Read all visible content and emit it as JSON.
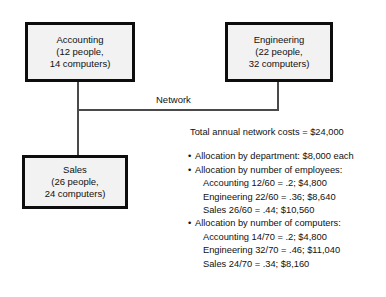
{
  "diagram": {
    "network_label": "Network",
    "nodes": [
      {
        "id": "accounting",
        "name": "Accounting",
        "people": "(12 people,",
        "computers": "14 computers)"
      },
      {
        "id": "engineering",
        "name": "Engineering",
        "people": "(22 people,",
        "computers": "32 computers)"
      },
      {
        "id": "sales",
        "name": "Sales",
        "people": "(26 people,",
        "computers": "24 computers)"
      }
    ]
  },
  "notes": {
    "total_cost": "Total annual network costs = $24,000",
    "bullet_glyph": "•",
    "allocations": [
      {
        "heading": "Allocation by department: $8,000 each",
        "items": []
      },
      {
        "heading": "Allocation by number of employees:",
        "items": [
          "Accounting 12/60 = .2; $4,800",
          "Engineering 22/60 = .36; $8,640",
          "Sales 26/60 = .44; $10,560"
        ]
      },
      {
        "heading": "Allocation by number of computers:",
        "items": [
          "Accounting 14/70 = .2; $4,800",
          "Engineering 32/70 = .46; $11,040",
          "Sales 24/70 = .34; $8,160"
        ]
      }
    ]
  },
  "colors": {
    "box_fill": "#f2f2f2",
    "box_border": "#0d0d0d",
    "link": "#4a4a4a",
    "text": "#111111",
    "background": "#ffffff"
  }
}
